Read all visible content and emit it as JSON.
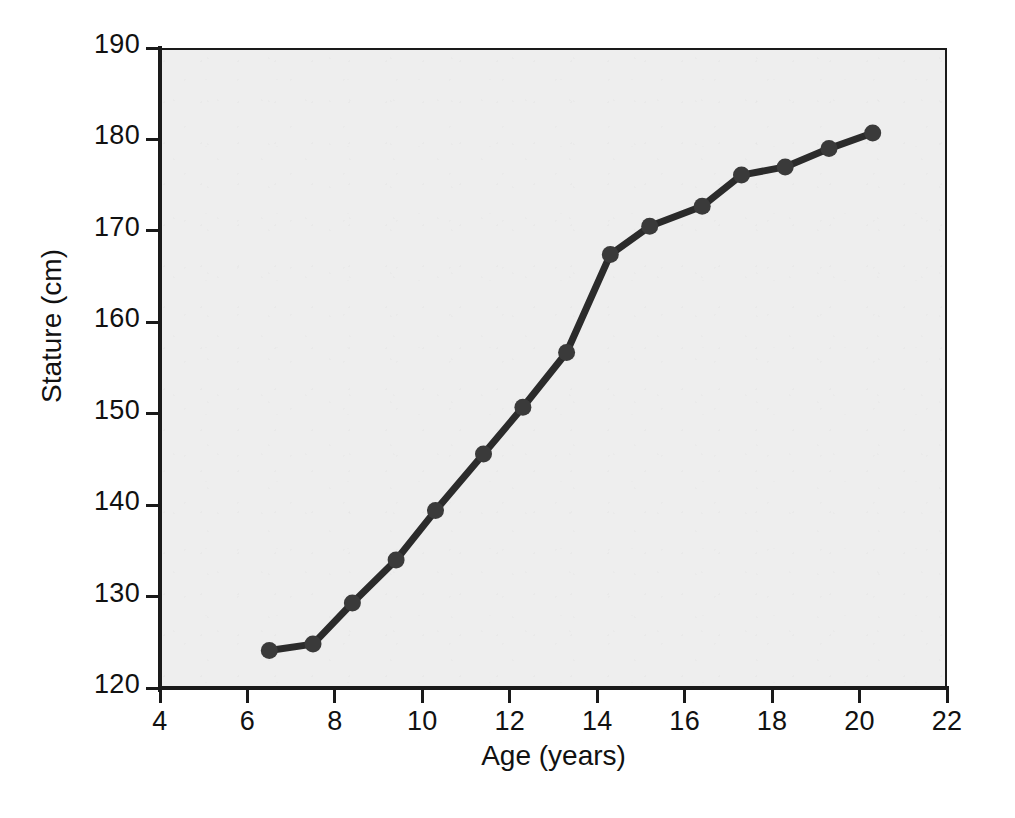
{
  "chart_data": {
    "type": "line",
    "title": "",
    "subtitle": "",
    "xlabel": "Age (years)",
    "ylabel": "Stature (cm)",
    "xlim": [
      4,
      22
    ],
    "ylim": [
      120,
      190
    ],
    "xticks": [
      4,
      6,
      8,
      10,
      12,
      14,
      16,
      18,
      20,
      22
    ],
    "yticks": [
      120,
      130,
      140,
      150,
      160,
      170,
      180,
      190
    ],
    "grid": false,
    "legend": null,
    "legend_position": "none",
    "annotations": [],
    "marker": "circle",
    "line_color": "#2b2b2b",
    "marker_color": "#3a3a3a",
    "plot_background": "#eeeeee",
    "series": [
      {
        "name": "Stature",
        "x": [
          6.5,
          7.5,
          8.4,
          9.4,
          10.3,
          11.4,
          12.3,
          13.3,
          14.3,
          15.2,
          16.4,
          17.3,
          18.3,
          19.3,
          20.3
        ],
        "values": [
          124.1,
          124.8,
          129.3,
          134.0,
          139.4,
          145.6,
          150.7,
          156.7,
          167.4,
          170.5,
          172.7,
          176.1,
          177.0,
          179.0,
          180.7
        ]
      }
    ]
  },
  "axis": {
    "y_tick_labels": [
      "190",
      "180",
      "170",
      "160",
      "150",
      "140",
      "130",
      "120"
    ],
    "x_tick_labels": [
      "4",
      "6",
      "8",
      "10",
      "12",
      "14",
      "16",
      "18",
      "20",
      "22"
    ],
    "y_title": "Stature (cm)",
    "x_title": "Age (years)"
  }
}
